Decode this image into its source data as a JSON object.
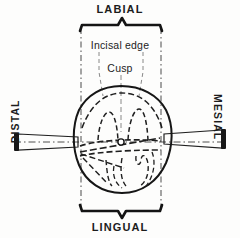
{
  "figure": {
    "background_color": "#fdfdfc",
    "ink_color": "#1a1a1a"
  },
  "labels": {
    "labial": "LABIAL",
    "lingual": "LINGUAL",
    "distal": "DISTAL",
    "mesial": "MESIAL",
    "incisal_edge": "Incisal edge",
    "cusp": "Cusp"
  },
  "annotations": {
    "center_point": "o",
    "top_bracket": "labial-extent-bracket",
    "bottom_bracket": "lingual-extent-bracket",
    "left_arrow": "distal-direction-bar",
    "right_arrow": "mesial-direction-bar"
  }
}
